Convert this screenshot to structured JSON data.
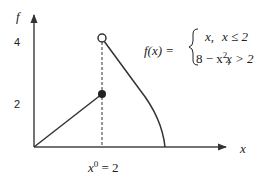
{
  "diagram": {
    "axes": {
      "y_label": "f",
      "x_label": "x"
    },
    "ticks": {
      "y_4": "4",
      "y_2": "2"
    },
    "x0_label": {
      "base": "x",
      "superscript": "0",
      "rest": " = 2"
    },
    "formula": {
      "lhs": "f(x) =",
      "case1_expr": "x,",
      "case1_cond": "x ≤ 2",
      "case2_expr_a": "8 − x",
      "case2_expr_sup": "2",
      "case2_expr_b": ",",
      "case2_cond": "x > 2"
    },
    "colors": {
      "line": "#333333",
      "text": "#222222"
    }
  }
}
